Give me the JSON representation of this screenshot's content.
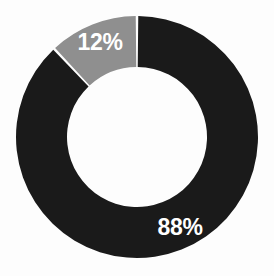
{
  "chart_data": {
    "type": "pie",
    "variant": "donut",
    "title": "",
    "subtitle": "",
    "xlabel": "",
    "ylabel": "",
    "units": "percent",
    "total": 100,
    "legend": {
      "visible": false,
      "position": "none"
    },
    "grid": false,
    "categories": [
      "88%",
      "12%"
    ],
    "values": [
      88,
      12
    ],
    "slices": [
      {
        "label": "88%",
        "value": 88,
        "color": "#1a1a1a",
        "label_color": "#ffffff",
        "start_angle_deg": 0,
        "end_angle_deg": 316.8
      },
      {
        "label": "12%",
        "value": 12,
        "color": "#8f8f8f",
        "label_color": "#ffffff",
        "start_angle_deg": 316.8,
        "end_angle_deg": 360
      }
    ],
    "geometry": {
      "center_x": 137,
      "center_y": 137,
      "outer_radius": 121,
      "inner_radius": 70,
      "start_at_deg": 0,
      "direction": "clockwise",
      "gap_deg": 1.2
    },
    "label_positions": [
      {
        "label": "88%",
        "x": 180,
        "y": 229
      },
      {
        "label": "12%",
        "x": 100,
        "y": 44
      }
    ]
  },
  "colors": {
    "background": "#fdfdfd",
    "dark_slice": "#1a1a1a",
    "gray_slice": "#8f8f8f",
    "label_text": "#ffffff"
  },
  "labels": {
    "major": "88%",
    "minor": "12%"
  }
}
